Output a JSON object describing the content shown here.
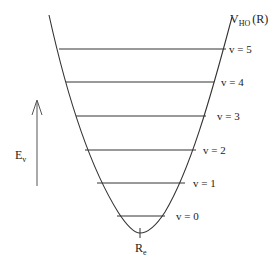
{
  "diagram": {
    "potential_label": "V",
    "potential_subscript": "HO",
    "potential_arg": "(R)",
    "energy_axis_label": "E",
    "energy_axis_subscript": "v",
    "equilibrium_label": "R",
    "equilibrium_subscript": "e",
    "levels": [
      {
        "label": "v = 0",
        "y": 216,
        "x1": 117,
        "x2": 163
      },
      {
        "label": "v = 1",
        "y": 183,
        "x1": 97,
        "x2": 183
      },
      {
        "label": "v = 2",
        "y": 150,
        "x1": 85,
        "x2": 196
      },
      {
        "label": "v = 3",
        "y": 116,
        "x1": 76,
        "x2": 206
      },
      {
        "label": "v = 4",
        "y": 82,
        "x1": 66,
        "x2": 213
      },
      {
        "label": "v = 5",
        "y": 49,
        "x1": 59,
        "x2": 225
      }
    ],
    "colors": {
      "line": "#333333",
      "text": "#222222",
      "background": "#ffffff"
    }
  }
}
